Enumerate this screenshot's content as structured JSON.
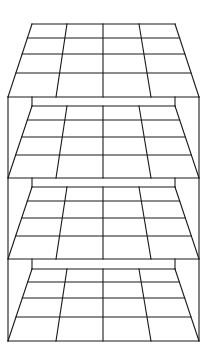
{
  "diagram": {
    "title": "",
    "stroke_color": "#1a1a1a",
    "background": "#ffffff",
    "box": {
      "outer_left": 8,
      "outer_right": 199,
      "inner_left": 32,
      "inner_right": 175,
      "top": 97,
      "bottom": 341
    },
    "grids": [
      {
        "name": "top-face",
        "back_y": 24,
        "front_y": 97,
        "rows_y": [
          24,
          38,
          54,
          73,
          97
        ]
      },
      {
        "name": "shelf-1",
        "wall_top": 97,
        "back_y": 106,
        "front_y": 178,
        "rows_y": [
          106,
          120,
          137,
          155,
          178
        ]
      },
      {
        "name": "shelf-2",
        "wall_top": 178,
        "back_y": 187,
        "front_y": 259,
        "rows_y": [
          187,
          201,
          218,
          236,
          259
        ]
      },
      {
        "name": "shelf-3",
        "wall_top": 259,
        "back_y": 269,
        "front_y": 341,
        "rows_y": [
          269,
          282,
          298,
          317,
          341
        ]
      }
    ],
    "columns": {
      "back_x": [
        32,
        67,
        103,
        139,
        175
      ],
      "front_x": [
        8,
        56,
        103,
        151,
        199
      ]
    }
  }
}
